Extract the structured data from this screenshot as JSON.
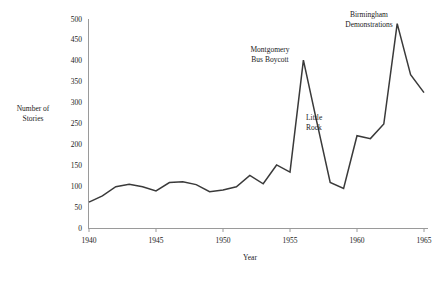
{
  "chart_data": {
    "type": "line",
    "title": "",
    "xlabel": "Year",
    "ylabel": "Number of\nStories",
    "xlim": [
      1940,
      1965
    ],
    "ylim": [
      0,
      500
    ],
    "grid": false,
    "legend": "none",
    "line_color": "#3a3a3a",
    "x": [
      1940,
      1941,
      1942,
      1943,
      1944,
      1945,
      1946,
      1947,
      1948,
      1949,
      1950,
      1951,
      1952,
      1953,
      1954,
      1955,
      1956,
      1957,
      1958,
      1959,
      1960,
      1961,
      1962,
      1963,
      1964,
      1965
    ],
    "values": [
      63,
      78,
      100,
      106,
      100,
      90,
      110,
      112,
      105,
      88,
      92,
      100,
      127,
      107,
      152,
      135,
      403,
      255,
      110,
      96,
      222,
      215,
      250,
      490,
      368,
      325
    ],
    "xticks": [
      1940,
      1945,
      1950,
      1955,
      1960,
      1965
    ],
    "xtick_labels": [
      "1940",
      "1945",
      "1950",
      "1955",
      "1960",
      "1965"
    ],
    "yticks": [
      0,
      50,
      100,
      150,
      200,
      250,
      300,
      350,
      400,
      450,
      500
    ],
    "ytick_labels": [
      "0",
      "50",
      "100",
      "150",
      "200",
      "250",
      "300",
      "350",
      "400",
      "450",
      "500"
    ],
    "annotations": [
      {
        "text": "Montgomery\nBus Boycott",
        "x": 1956,
        "y": 403
      },
      {
        "text": "Little\nRock",
        "x": 1958,
        "y": 255
      },
      {
        "text": "Birmingham\nDemonstrations",
        "x": 1963,
        "y": 490
      }
    ]
  }
}
